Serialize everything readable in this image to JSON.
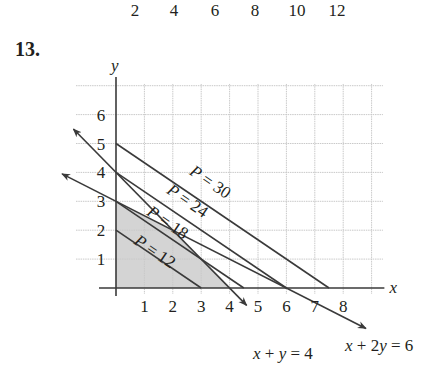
{
  "header": {
    "top_ticks": [
      "2",
      "4",
      "6",
      "8",
      "10",
      "12"
    ],
    "problem_number": "13."
  },
  "chart_data": {
    "type": "line",
    "title": "",
    "xlabel": "x",
    "ylabel": "y",
    "xlim": [
      0,
      9.4
    ],
    "ylim": [
      0,
      7
    ],
    "grid": true,
    "x_ticks": [
      "1",
      "2",
      "3",
      "4",
      "5",
      "6",
      "7",
      "8"
    ],
    "y_ticks": [
      "1",
      "2",
      "3",
      "4",
      "5",
      "6"
    ],
    "feasible_region": {
      "fill": "#d4d4d4",
      "vertices": [
        [
          0,
          0
        ],
        [
          0,
          3
        ],
        [
          2,
          2
        ],
        [
          4,
          0
        ]
      ]
    },
    "constraint_lines": [
      {
        "name": "x + y = 4",
        "label": "x + y = 4",
        "from": [
          -1.5,
          5.5
        ],
        "to": [
          4.6,
          -0.6
        ]
      },
      {
        "name": "x + 2y = 6",
        "label": "x + 2y = 6",
        "from": [
          -1.9,
          3.95
        ],
        "to": [
          8.8,
          -1.4
        ]
      }
    ],
    "objective_lines": [
      {
        "label": "P = 12",
        "value": 12,
        "from": [
          0,
          2
        ],
        "to": [
          3,
          0
        ]
      },
      {
        "label": "P = 18",
        "value": 18,
        "from": [
          0,
          3
        ],
        "to": [
          4.5,
          0
        ]
      },
      {
        "label": "P = 24",
        "value": 24,
        "from": [
          0,
          4
        ],
        "to": [
          6,
          0
        ]
      },
      {
        "label": "P = 30",
        "value": 30,
        "from": [
          0,
          5
        ],
        "to": [
          7.5,
          0
        ]
      }
    ],
    "colors": {
      "line": "#3a3a3a",
      "grid": "#c9c9c9",
      "region": "#d4d4d4"
    }
  }
}
